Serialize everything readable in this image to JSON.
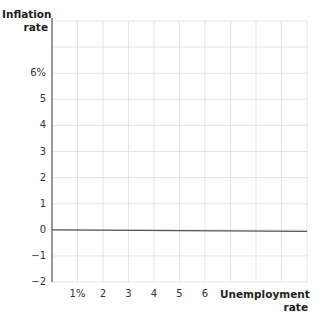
{
  "chart_data": {
    "type": "line",
    "title": "",
    "xlabel": "Unemployment rate",
    "ylabel": "Inflation rate",
    "xlabel_lines": [
      "Unemployment",
      "rate"
    ],
    "ylabel_lines": [
      "Inflation",
      "rate"
    ],
    "x_ticks": [
      {
        "value": 1,
        "label": "1%"
      },
      {
        "value": 2,
        "label": "2"
      },
      {
        "value": 3,
        "label": "3"
      },
      {
        "value": 4,
        "label": "4"
      },
      {
        "value": 5,
        "label": "5"
      },
      {
        "value": 6,
        "label": "6"
      }
    ],
    "y_ticks": [
      {
        "value": 6,
        "label": "6%"
      },
      {
        "value": 5,
        "label": "5"
      },
      {
        "value": 4,
        "label": "4"
      },
      {
        "value": 3,
        "label": "3"
      },
      {
        "value": 2,
        "label": "2"
      },
      {
        "value": 1,
        "label": "1"
      },
      {
        "value": 0,
        "label": "0"
      },
      {
        "value": -1,
        "label": "−1"
      },
      {
        "value": -2,
        "label": "−2"
      }
    ],
    "xlim": [
      0,
      10
    ],
    "ylim": [
      -2,
      8
    ],
    "grid": true,
    "grid_color": "#dddddd",
    "axis_color": "#555555",
    "series": [
      {
        "name": "zero-inflation line",
        "x": [
          0,
          10
        ],
        "y": [
          0,
          0
        ],
        "color": "#555555"
      }
    ],
    "legend": null
  }
}
